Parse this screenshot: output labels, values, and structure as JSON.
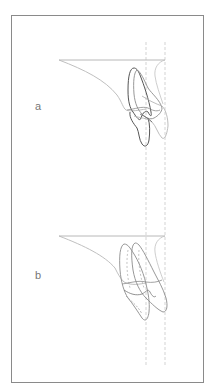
{
  "figure": {
    "panels": [
      {
        "label": "a"
      },
      {
        "label": "b"
      }
    ],
    "colors": {
      "frame": "#8a8a8a",
      "reference_line": "#b8b8b8",
      "outline_dark": "#555555",
      "outline_mid": "#8c8c8c",
      "outline_light": "#b5b5b5",
      "dashed_guide": "#c8c8c8",
      "label": "#777777"
    }
  }
}
